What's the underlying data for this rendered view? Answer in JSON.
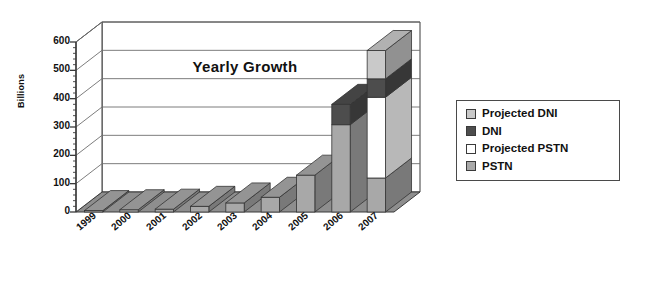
{
  "chart_data": {
    "type": "bar",
    "subtype": "stacked-3d-column",
    "title": "Yearly Growth",
    "xlabel": "",
    "ylabel": "Billions",
    "ylim": [
      0,
      600
    ],
    "yticks": [
      600,
      500,
      400,
      300,
      200,
      100,
      0
    ],
    "ytick_labels": [
      "600",
      "500",
      "400",
      "300",
      "200",
      "100",
      "0"
    ],
    "minor_ticks": true,
    "grid": true,
    "grid_axis": "y",
    "legend_position": "right",
    "categories": [
      "1999",
      "2000",
      "2001",
      "2002",
      "2003",
      "2004",
      "2005",
      "2006",
      "2007"
    ],
    "series": [
      {
        "name": "PSTN",
        "color": "#a8a8a8",
        "values": [
          5,
          8,
          10,
          20,
          32,
          52,
          130,
          308,
          120
        ]
      },
      {
        "name": "Projected PSTN",
        "color": "#ffffff",
        "values": [
          0,
          0,
          0,
          0,
          0,
          0,
          0,
          0,
          285
        ]
      },
      {
        "name": "DNI",
        "color": "#4d4d4d",
        "values": [
          0,
          0,
          0,
          0,
          0,
          0,
          0,
          72,
          65
        ]
      },
      {
        "name": "Projected DNI",
        "color": "#c9c9c9",
        "values": [
          0,
          0,
          0,
          0,
          0,
          0,
          0,
          0,
          100
        ]
      }
    ],
    "totals": [
      5,
      8,
      10,
      20,
      32,
      52,
      130,
      380,
      570
    ],
    "stack_order_bottom_to_top": [
      "PSTN",
      "Projected PSTN",
      "DNI",
      "Projected DNI"
    ],
    "units": "Billions"
  },
  "legend": {
    "items": [
      {
        "label": "Projected DNI",
        "color": "#c9c9c9"
      },
      {
        "label": "DNI",
        "color": "#4d4d4d"
      },
      {
        "label": "Projected PSTN",
        "color": "#ffffff"
      },
      {
        "label": "PSTN",
        "color": "#a8a8a8"
      }
    ]
  },
  "colors": {
    "axis": "#3a3a3a",
    "grid": "#6e6e6e",
    "floor": "#8e8e8e",
    "wall": "#ffffff",
    "text": "#111111"
  }
}
